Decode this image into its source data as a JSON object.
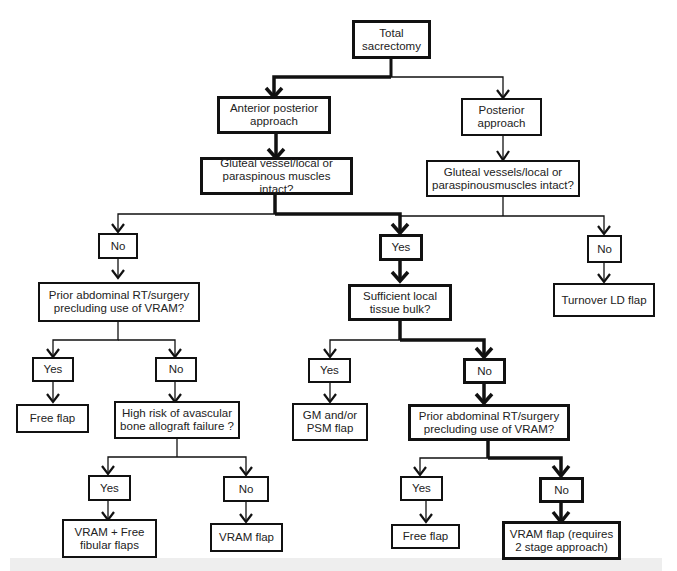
{
  "diagram": {
    "type": "flowchart",
    "nodes": {
      "total_sacrectomy": "Total\nsacrectomy",
      "anterior_posterior": "Anterior posterior\napproach",
      "posterior": "Posterior\napproach",
      "gluteal_ap": "Gluteal vessel/local or\nparaspinous muscles intact?",
      "gluteal_p": "Gluteal vessels/local or\nparaspinousmuscles intact?",
      "no_left": "No",
      "yes_center": "Yes",
      "no_right": "No",
      "prior_rt_left": "Prior abdominal RT/surgery\nprecluding use of VRAM?",
      "sufficient_bulk": "Sufficient local\ntissue bulk?",
      "turnover_ld": "Turnover LD flap",
      "yes_ll": "Yes",
      "no_lc": "No",
      "yes_cl": "Yes",
      "no_cr": "No",
      "free_flap_left": "Free flap",
      "high_risk": "High risk of avascular\nbone allograft failure ?",
      "gm_psm": "GM and/or\nPSM flap",
      "prior_rt_center": "Prior abdominal RT/surgery\nprecluding use of VRAM?",
      "yes_bl": "Yes",
      "no_bc": "No",
      "yes_br": "Yes",
      "no_brr": "No",
      "vram_free_fibular": "VRAM + Free\nfibular flaps",
      "vram_flap_left": "VRAM flap",
      "free_flap_right": "Free flap",
      "vram_two_stage": "VRAM flap (requires\n2 stage approach)"
    },
    "edges": [
      {
        "from": "total_sacrectomy",
        "to": "anterior_posterior",
        "emphasis": true
      },
      {
        "from": "total_sacrectomy",
        "to": "posterior",
        "emphasis": false
      },
      {
        "from": "anterior_posterior",
        "to": "gluteal_ap",
        "emphasis": true
      },
      {
        "from": "posterior",
        "to": "gluteal_p",
        "emphasis": false
      },
      {
        "from": "gluteal_ap",
        "to": "no_left",
        "emphasis": false
      },
      {
        "from": "gluteal_ap",
        "to": "yes_center",
        "emphasis": true
      },
      {
        "from": "gluteal_p",
        "to": "yes_center",
        "emphasis": false
      },
      {
        "from": "gluteal_p",
        "to": "no_right",
        "emphasis": false
      },
      {
        "from": "no_left",
        "to": "prior_rt_left",
        "emphasis": false
      },
      {
        "from": "yes_center",
        "to": "sufficient_bulk",
        "emphasis": true
      },
      {
        "from": "no_right",
        "to": "turnover_ld",
        "emphasis": false
      },
      {
        "from": "prior_rt_left",
        "to": "yes_ll",
        "emphasis": false
      },
      {
        "from": "prior_rt_left",
        "to": "no_lc",
        "emphasis": false
      },
      {
        "from": "sufficient_bulk",
        "to": "yes_cl",
        "emphasis": false
      },
      {
        "from": "sufficient_bulk",
        "to": "no_cr",
        "emphasis": true
      },
      {
        "from": "yes_ll",
        "to": "free_flap_left",
        "emphasis": false
      },
      {
        "from": "no_lc",
        "to": "high_risk",
        "emphasis": false
      },
      {
        "from": "yes_cl",
        "to": "gm_psm",
        "emphasis": false
      },
      {
        "from": "no_cr",
        "to": "prior_rt_center",
        "emphasis": true
      },
      {
        "from": "high_risk",
        "to": "yes_bl",
        "emphasis": false
      },
      {
        "from": "high_risk",
        "to": "no_bc",
        "emphasis": false
      },
      {
        "from": "prior_rt_center",
        "to": "yes_br",
        "emphasis": false
      },
      {
        "from": "prior_rt_center",
        "to": "no_brr",
        "emphasis": true
      },
      {
        "from": "yes_bl",
        "to": "vram_free_fibular",
        "emphasis": false
      },
      {
        "from": "no_bc",
        "to": "vram_flap_left",
        "emphasis": false
      },
      {
        "from": "yes_br",
        "to": "free_flap_right",
        "emphasis": false
      },
      {
        "from": "no_brr",
        "to": "vram_two_stage",
        "emphasis": true
      }
    ]
  }
}
